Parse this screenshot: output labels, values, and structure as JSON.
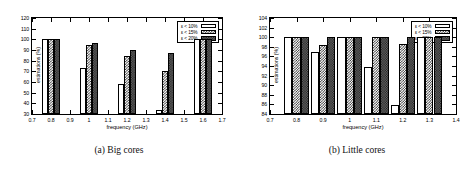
{
  "figure": {
    "panels": [
      {
        "id": "big-cores",
        "caption": "(a) Big cores"
      },
      {
        "id": "little-cores",
        "caption": "(b) Little cores"
      }
    ]
  },
  "legend": {
    "entries": [
      {
        "label": "ε < 10%",
        "style": "empty"
      },
      {
        "label": "ε < 15%",
        "style": "checker"
      },
      {
        "label": "ε < 20%",
        "style": "dense"
      }
    ]
  },
  "chart_data": [
    {
      "type": "bar",
      "title": "(a) Big cores",
      "xlabel": "frequency (GHz)",
      "ylabel": "estimations (%)",
      "xlim": [
        0.7,
        1.7
      ],
      "ylim": [
        30,
        120
      ],
      "yticks": [
        30,
        40,
        50,
        60,
        70,
        80,
        90,
        100,
        110,
        120
      ],
      "xticks": [
        0.7,
        0.8,
        0.9,
        1.0,
        1.1,
        1.2,
        1.3,
        1.4,
        1.5,
        1.6,
        1.7
      ],
      "xticklabels": [
        "0.7",
        "0.8",
        "0.9",
        "1",
        "1.1",
        "1.2",
        "1.3",
        "1.4",
        "1.5",
        "1.6",
        "1.7"
      ],
      "categories": [
        0.8,
        1.0,
        1.2,
        1.4,
        1.6
      ],
      "grid": false,
      "legend_position": "top-right",
      "series": [
        {
          "name": "ε < 10%",
          "values": [
            100,
            73.5,
            58,
            34,
            100
          ]
        },
        {
          "name": "ε < 15%",
          "values": [
            100,
            95,
            84,
            70,
            100
          ]
        },
        {
          "name": "ε < 20%",
          "values": [
            100,
            96.5,
            90,
            87,
            100
          ]
        }
      ]
    },
    {
      "type": "bar",
      "title": "(b) Little cores",
      "xlabel": "frequency (GHz)",
      "ylabel": "estimations (%)",
      "xlim": [
        0.7,
        1.4
      ],
      "ylim": [
        84,
        104
      ],
      "yticks": [
        84,
        86,
        88,
        90,
        92,
        94,
        96,
        98,
        100,
        102,
        104
      ],
      "xticks": [
        0.7,
        0.8,
        0.9,
        1.0,
        1.1,
        1.2,
        1.3,
        1.4
      ],
      "xticklabels": [
        "0.7",
        "0.8",
        "0.9",
        "1",
        "1.1",
        "1.2",
        "1.3",
        "1.4"
      ],
      "categories": [
        0.8,
        0.9,
        1.0,
        1.1,
        1.2,
        1.3
      ],
      "grid": false,
      "legend_position": "top-right",
      "series": [
        {
          "name": "ε < 10%",
          "values": [
            100,
            97,
            100,
            93.7,
            85.8,
            100
          ]
        },
        {
          "name": "ε < 15%",
          "values": [
            100,
            98.4,
            100,
            100,
            98.5,
            100
          ]
        },
        {
          "name": "ε < 20%",
          "values": [
            100,
            100,
            100,
            100,
            100,
            100
          ]
        }
      ]
    }
  ]
}
